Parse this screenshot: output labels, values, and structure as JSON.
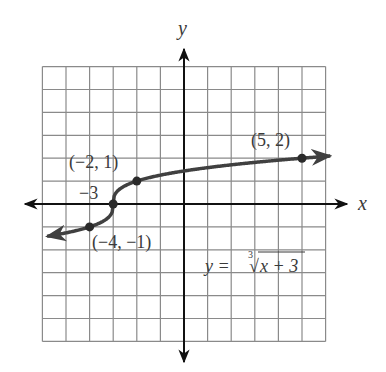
{
  "chart_data": {
    "type": "line",
    "title": "",
    "xlabel": "x",
    "ylabel": "y",
    "xlim": [
      -6,
      6
    ],
    "ylim": [
      -6,
      6
    ],
    "grid": true,
    "grid_step": 1,
    "equation": "y = ∛(x + 3)",
    "equation_parts": {
      "lhs": "y = ",
      "index": "3",
      "radical": "√",
      "radicand": "x + 3"
    },
    "series": [
      {
        "name": "y = cube root of (x + 3)",
        "function": "cbrt(x+3)",
        "domain": [
          -5.8,
          6.2
        ],
        "arrows": "both",
        "color": "#404040"
      }
    ],
    "points": [
      {
        "x": -4,
        "y": -1,
        "label": "(−4, −1)"
      },
      {
        "x": -3,
        "y": 0,
        "label": "−3"
      },
      {
        "x": -2,
        "y": 1,
        "label": "(−2, 1)"
      },
      {
        "x": 5,
        "y": 2,
        "label": "(5, 2)"
      }
    ]
  },
  "labels": {
    "x_axis": "x",
    "y_axis": "y",
    "p1": "(−2, 1)",
    "p2": "−3",
    "p3": "(−4, −1)",
    "p4": "(5, 2)",
    "eq_lhs": "y = ",
    "eq_index": "3",
    "eq_radical": "√",
    "eq_radicand": "x + 3"
  },
  "colors": {
    "grid": "#8a8a8a",
    "axis": "#111111",
    "curve": "#404040",
    "text": "#3a3a3a"
  }
}
